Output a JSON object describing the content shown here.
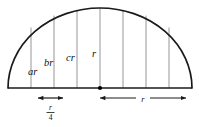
{
  "figure": {
    "name": "semicircle-with-vertical-chords",
    "background_color": "#ffffff",
    "arc_color": "#1a1a1a",
    "chord_color": "#8a8a8a",
    "label_color": "#111111",
    "geometry": {
      "center_x": 100,
      "baseline_y": 88,
      "radius_x": 92,
      "radius_y": 80,
      "left_edge_x": 8,
      "right_edge_x": 192,
      "apex_y": 8
    },
    "chords": [
      {
        "id": "chord-1",
        "x": 31,
        "label": "ar"
      },
      {
        "id": "chord-2",
        "x": 54,
        "label": "br"
      },
      {
        "id": "chord-3",
        "x": 77,
        "label": "cr"
      },
      {
        "id": "chord-4",
        "x": 100,
        "label": "r"
      },
      {
        "id": "chord-5",
        "x": 123,
        "label": ""
      },
      {
        "id": "chord-6",
        "x": 146,
        "label": ""
      },
      {
        "id": "chord-7",
        "x": 169,
        "label": ""
      }
    ],
    "chord_labels": [
      {
        "text": "ar",
        "x": 33,
        "y": 72
      },
      {
        "text": "br",
        "x": 48,
        "y": 63
      },
      {
        "text": "cr",
        "x": 71,
        "y": 58
      },
      {
        "text": "r",
        "x": 95,
        "y": 55
      }
    ],
    "center_dot": {
      "x": 100,
      "y": 88,
      "radius": 2.1
    },
    "dimensions": [
      {
        "id": "dim-quarter-r",
        "x_start": 38,
        "x_end": 63,
        "y": 98,
        "label_numerator": "r",
        "label_denominator": "4",
        "label_text": "r/4",
        "label_x": 50.5,
        "label_type": "fraction"
      },
      {
        "id": "dim-radius-r",
        "x_start": 100,
        "x_end": 186,
        "y": 98,
        "label_text": "r",
        "label_x": 143,
        "label_type": "simple"
      }
    ]
  }
}
